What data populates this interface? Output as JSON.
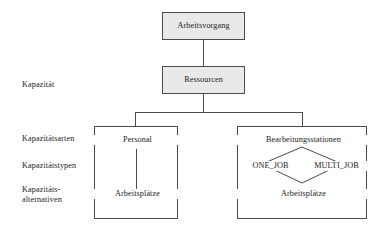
{
  "diagram": {
    "accent_border": "#4a4a4a",
    "shaded_fill": "#e9e9e9",
    "plain_fill": "#ffffff",
    "row_labels": {
      "kapazitaet": "Kapazität",
      "kapazitaetsarten": "Kapazitätsarten",
      "kapazitaetstypen": "Kapazitätstypen",
      "kapazitaetsalternativen_line1": "Kapazitäts-",
      "kapazitaetsalternativen_line2": "alternativen"
    },
    "nodes": {
      "arbeitsvorgang": "Arbeitsvorgang",
      "ressourcen": "Ressourcen",
      "personal": "Personal",
      "personal_arbeitsplaetze": "Arbeitsplätze",
      "bearbeitungsstationen": "Bearbeitungsstationen",
      "one_job": "ONE_JOB",
      "multi_job": "MULTI_JOB",
      "stationen_arbeitsplaetze": "Arbeitsplätze"
    }
  }
}
